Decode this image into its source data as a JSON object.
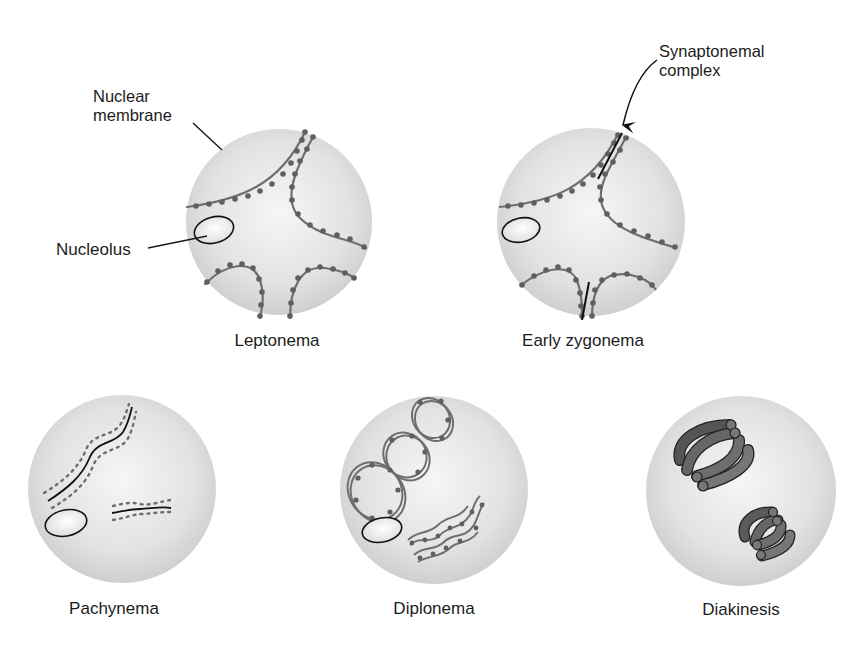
{
  "stages": [
    {
      "id": "leptonema",
      "label": "Leptonema",
      "cx": 279,
      "cy": 222,
      "r": 93
    },
    {
      "id": "early-zygonema",
      "label": "Early zygonema",
      "cx": 591,
      "cy": 222,
      "r": 94
    },
    {
      "id": "pachynema",
      "label": "Pachynema",
      "cx": 122,
      "cy": 489,
      "r": 94
    },
    {
      "id": "diplonema",
      "label": "Diplonema",
      "cx": 434,
      "cy": 490,
      "r": 94
    },
    {
      "id": "diakinesis",
      "label": "Diakinesis",
      "cx": 741,
      "cy": 491,
      "r": 95
    }
  ],
  "callouts": {
    "nuclear_membrane": "Nuclear\nmembrane",
    "nucleolus": "Nucleolus",
    "synaptonemal_complex": "Synaptonemal\ncomplex"
  },
  "colors": {
    "nucleus_fill_center": "#f4f4f4",
    "nucleus_fill_edge": "#d2d2d2",
    "chromosome": "#6e6e6e",
    "chromosome_bead": "#5f5f5f",
    "synaptonemal_line": "#111111",
    "bivalent_dark": "#555555",
    "bivalent_mid": "#707070",
    "leader_line": "#1a1a1a"
  }
}
